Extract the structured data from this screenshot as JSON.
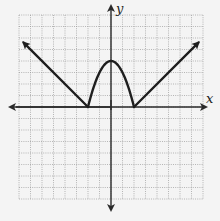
{
  "chart_data": {
    "type": "line",
    "title": "",
    "xlabel": "x",
    "ylabel": "y",
    "grid": true,
    "grid_units_per_cell": 1,
    "xlim": [
      -8,
      8
    ],
    "ylim": [
      -8,
      8
    ],
    "series": [
      {
        "name": "piecewise f(x)",
        "description": "y = |x| - 2 for |x| >= 2 (rays with arrows); y = 4 - x^2 for -2 <= x <= 2 (parabolic arch)",
        "segments": [
          {
            "kind": "ray",
            "points": [
              [
                2,
                0
              ],
              [
                7.6,
                5.6
              ]
            ],
            "arrow_end": true
          },
          {
            "kind": "parabola",
            "vertex": [
              0,
              4
            ],
            "roots": [
              -2,
              2
            ]
          },
          {
            "kind": "ray",
            "points": [
              [
                -2,
                0
              ],
              [
                -7.6,
                5.6
              ]
            ],
            "arrow_end": true
          }
        ],
        "key_points": [
          [
            -2,
            0
          ],
          [
            0,
            4
          ],
          [
            2,
            0
          ]
        ]
      }
    ]
  },
  "labels": {
    "x_axis": "x",
    "y_axis": "y"
  },
  "colors": {
    "background": "#f4f4f4",
    "curve": "#1e1e1e",
    "grid": "#9a9a9a",
    "axis": "#2a2a2a"
  }
}
